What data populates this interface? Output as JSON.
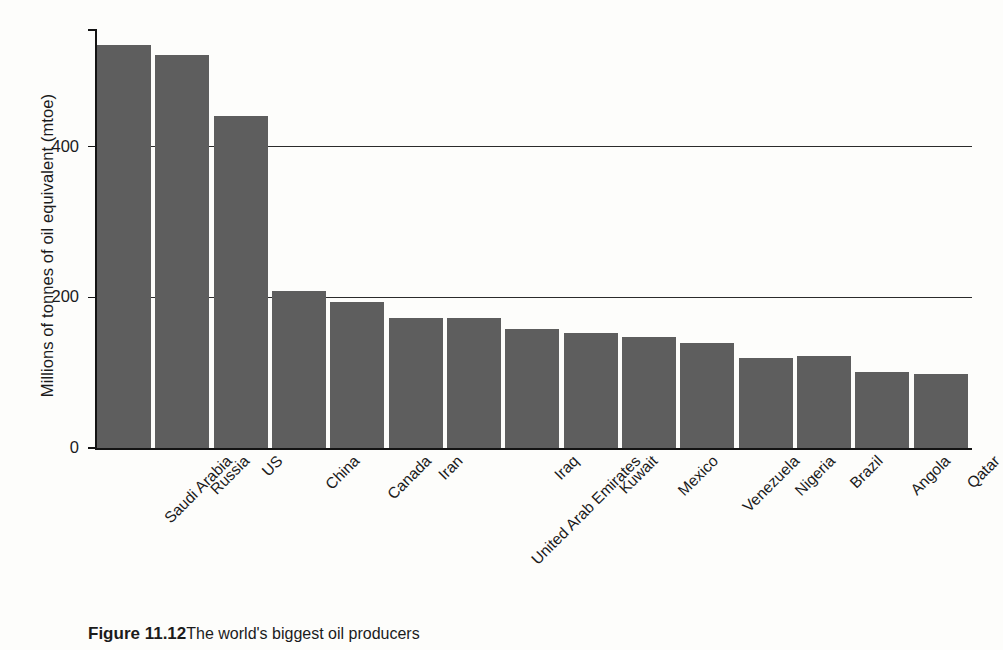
{
  "chart_data": {
    "type": "bar",
    "title": "",
    "xlabel": "",
    "ylabel": "Millions of tonnes of oil equivalent (mtoe)",
    "ylim": [
      0,
      555
    ],
    "yticks": [
      0,
      200,
      400
    ],
    "ytick_labels": [
      "0",
      "200",
      "400"
    ],
    "grid": "horizontal gridlines at 200 and 400 spanning full plot width",
    "legend": "none",
    "bar_color": "#5e5e5e",
    "categories": [
      "Saudi Arabia",
      "Russia",
      "US",
      "China",
      "Canada",
      "Iran",
      "United Arab Emirates",
      "Iraq",
      "Kuwait",
      "Mexico",
      "Venezuela",
      "Nigeria",
      "Brazil",
      "Angola",
      "Qatar"
    ],
    "values": [
      535,
      522,
      441,
      208,
      194,
      172,
      172,
      158,
      153,
      148,
      140,
      120,
      122,
      101,
      98
    ]
  },
  "axis": {
    "y_title": "Millions of tonnes of oil equivalent (mtoe)"
  },
  "caption": {
    "label": "Figure 11.12",
    "text": "The world's biggest oil producers"
  }
}
